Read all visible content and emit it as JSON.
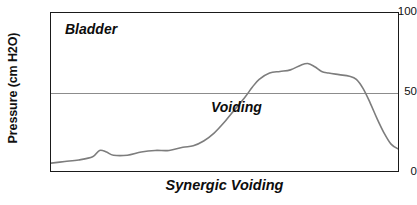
{
  "chart_data": {
    "type": "line",
    "title": "",
    "caption": "Synergic Voiding",
    "xlabel": "",
    "ylabel": "Pressure (cm H2O)",
    "ylim": [
      0,
      100
    ],
    "yticks": [
      0,
      50,
      100
    ],
    "ytick_labels": [
      "0",
      "50",
      "100"
    ],
    "xlim": [
      0,
      100
    ],
    "xticks": [],
    "xtick_labels": [],
    "grid": "horizontal gridline at y=50 only",
    "legend": "none",
    "annotations": [
      {
        "text": "Bladder",
        "x": 5,
        "y": 92
      },
      {
        "text": "Voiding",
        "x": 32,
        "y": 42
      }
    ],
    "series": [
      {
        "name": "Bladder pressure",
        "color": "#7d7d7d",
        "points": [
          {
            "x": 0,
            "y": 5
          },
          {
            "x": 4,
            "y": 6
          },
          {
            "x": 8,
            "y": 7
          },
          {
            "x": 12,
            "y": 9
          },
          {
            "x": 14,
            "y": 13
          },
          {
            "x": 16,
            "y": 12
          },
          {
            "x": 18,
            "y": 10
          },
          {
            "x": 22,
            "y": 10
          },
          {
            "x": 26,
            "y": 12
          },
          {
            "x": 30,
            "y": 13
          },
          {
            "x": 34,
            "y": 13
          },
          {
            "x": 38,
            "y": 15
          },
          {
            "x": 41,
            "y": 16
          },
          {
            "x": 44,
            "y": 19
          },
          {
            "x": 47,
            "y": 24
          },
          {
            "x": 50,
            "y": 31
          },
          {
            "x": 53,
            "y": 39
          },
          {
            "x": 56,
            "y": 47
          },
          {
            "x": 58,
            "y": 53
          },
          {
            "x": 60,
            "y": 58
          },
          {
            "x": 63,
            "y": 62
          },
          {
            "x": 66,
            "y": 63
          },
          {
            "x": 69,
            "y": 64
          },
          {
            "x": 72,
            "y": 67
          },
          {
            "x": 74,
            "y": 68
          },
          {
            "x": 76,
            "y": 66
          },
          {
            "x": 78,
            "y": 63
          },
          {
            "x": 80,
            "y": 62
          },
          {
            "x": 83,
            "y": 61
          },
          {
            "x": 86,
            "y": 60
          },
          {
            "x": 88,
            "y": 58
          },
          {
            "x": 90,
            "y": 52
          },
          {
            "x": 92,
            "y": 43
          },
          {
            "x": 94,
            "y": 33
          },
          {
            "x": 96,
            "y": 24
          },
          {
            "x": 98,
            "y": 17
          },
          {
            "x": 100,
            "y": 14
          },
          {
            "x": 104,
            "y": 11
          },
          {
            "x": 110,
            "y": 10
          },
          {
            "x": 120,
            "y": 10
          }
        ]
      }
    ]
  },
  "axis": {
    "ylabel": "Pressure (cm H2O)",
    "ytick_100": "100",
    "ytick_50": "50",
    "ytick_0": "0"
  },
  "labels": {
    "bladder": "Bladder",
    "voiding": "Voiding",
    "caption": "Synergic Voiding"
  },
  "colors": {
    "curve": "#7d7d7d",
    "gridline": "#8c8c8c",
    "frame": "#1a1a1a",
    "text": "#0d0d0d",
    "background": "#ffffff"
  }
}
